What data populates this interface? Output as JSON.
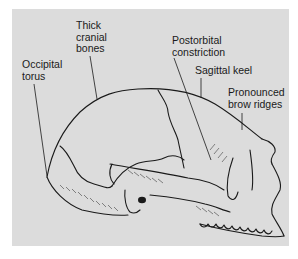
{
  "diagram": {
    "background_color": "#dcdcdc",
    "line_color": "#1a1a1a",
    "labels": [
      {
        "id": "occipital-torus",
        "text": "Occipital\ntorus",
        "x": 22,
        "y": 59
      },
      {
        "id": "thick-cranial-bones",
        "text": "Thick\ncranial\nbones",
        "x": 76,
        "y": 20
      },
      {
        "id": "postorbital-constriction",
        "text": "Postorbital\nconstriction",
        "x": 172,
        "y": 35
      },
      {
        "id": "sagittal-keel",
        "text": "Sagittal keel",
        "x": 195,
        "y": 65
      },
      {
        "id": "pronounced-brow-ridges",
        "text": "Pronounced\nbrow ridges",
        "x": 228,
        "y": 87
      }
    ]
  }
}
